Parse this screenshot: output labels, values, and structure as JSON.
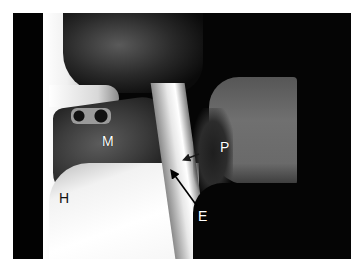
{
  "image": {
    "type": "lateral radiograph (videofluoroscopy) of head and neck",
    "frame": {
      "x": 13,
      "y": 13,
      "width": 338,
      "height": 246
    }
  },
  "labels": [
    {
      "id": "M",
      "text": "M",
      "x": 102,
      "y": 134
    },
    {
      "id": "P",
      "text": "P",
      "x": 220,
      "y": 140
    },
    {
      "id": "H",
      "text": "H",
      "x": 59,
      "y": 192
    },
    {
      "id": "E",
      "text": "E",
      "x": 198,
      "y": 210
    }
  ],
  "arrows": [
    {
      "name": "epiglottis-arrow",
      "from": [
        197,
        206
      ],
      "to": [
        171,
        170
      ],
      "color": "#000000"
    },
    {
      "name": "pharynx-arrow",
      "from": [
        199,
        154
      ],
      "to": [
        184,
        160
      ],
      "color": "#1a1a1a"
    }
  ],
  "colors": {
    "background": "#ffffff",
    "film_dark": "#050505",
    "bright_soft_tissue": "#f5f5f5",
    "spine_gray": "#6e6e6e",
    "label_text": "#ffffff"
  }
}
